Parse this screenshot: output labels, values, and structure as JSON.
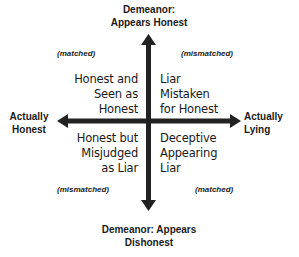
{
  "diagram": {
    "top_label": [
      "Demeanor:",
      "Appears Honest"
    ],
    "bottom_label": [
      "Demeanor: Appears",
      "Dishonest"
    ],
    "left_label": [
      "Actually",
      "Honest"
    ],
    "right_label": [
      "Actually",
      "Lying"
    ],
    "quadrants": {
      "top_left": {
        "lines": [
          "Honest and",
          "Seen as",
          "Honest"
        ],
        "tag": "(matched)"
      },
      "top_right": {
        "lines": [
          "Liar",
          "Mistaken",
          "for Honest"
        ],
        "tag": "(mismatched)"
      },
      "bottom_left": {
        "lines": [
          "Honest but",
          "Misjudged",
          "as Liar"
        ],
        "tag": "(mismatched)"
      },
      "bottom_right": {
        "lines": [
          "Deceptive",
          "Appearing",
          "Liar"
        ],
        "tag": "(matched)"
      }
    },
    "colors": {
      "axis": "#222222",
      "text": "#1a1a1a"
    }
  }
}
